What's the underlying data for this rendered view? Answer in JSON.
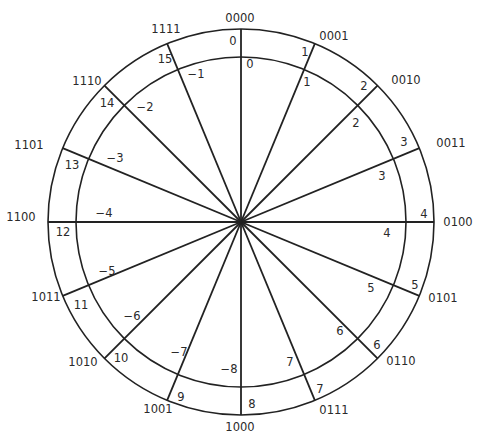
{
  "diagram": {
    "geometry": {
      "center": [
        241,
        222
      ],
      "outer_radius": 193,
      "inner_radius": 165,
      "spoke_count": 16,
      "start_angle_deg": 0,
      "direction": "clockwise"
    },
    "colors": {
      "line": "#222222",
      "text": "#2a2a2a",
      "background": "#ffffff"
    },
    "segments": [
      {
        "index": 0,
        "binary": "0000",
        "unsigned": "0",
        "signed": "0",
        "binary_pos": [
          240,
          18
        ],
        "unsigned_pos": [
          233,
          41
        ],
        "signed_pos": [
          250,
          64
        ]
      },
      {
        "index": 1,
        "binary": "0001",
        "unsigned": "1",
        "signed": "1",
        "binary_pos": [
          334,
          36
        ],
        "unsigned_pos": [
          305,
          52
        ],
        "signed_pos": [
          307,
          82
        ]
      },
      {
        "index": 2,
        "binary": "0010",
        "unsigned": "2",
        "signed": "2",
        "binary_pos": [
          406,
          80
        ],
        "unsigned_pos": [
          364,
          86
        ],
        "signed_pos": [
          356,
          123
        ]
      },
      {
        "index": 3,
        "binary": "0011",
        "unsigned": "3",
        "signed": "3",
        "binary_pos": [
          451,
          143
        ],
        "unsigned_pos": [
          404,
          142
        ],
        "signed_pos": [
          382,
          176
        ]
      },
      {
        "index": 4,
        "binary": "0100",
        "unsigned": "4",
        "signed": "4",
        "binary_pos": [
          458,
          222
        ],
        "unsigned_pos": [
          424,
          214
        ],
        "signed_pos": [
          387,
          233
        ]
      },
      {
        "index": 5,
        "binary": "0101",
        "unsigned": "5",
        "signed": "5",
        "binary_pos": [
          443,
          298
        ],
        "unsigned_pos": [
          415,
          285
        ],
        "signed_pos": [
          371,
          288
        ]
      },
      {
        "index": 6,
        "binary": "0110",
        "unsigned": "6",
        "signed": "6",
        "binary_pos": [
          401,
          361
        ],
        "unsigned_pos": [
          377,
          345
        ],
        "signed_pos": [
          340,
          331
        ]
      },
      {
        "index": 7,
        "binary": "0111",
        "unsigned": "7",
        "signed": "7",
        "binary_pos": [
          334,
          410
        ],
        "unsigned_pos": [
          320,
          389
        ],
        "signed_pos": [
          290,
          362
        ]
      },
      {
        "index": 8,
        "binary": "1000",
        "unsigned": "8",
        "signed": "−8",
        "binary_pos": [
          240,
          427
        ],
        "unsigned_pos": [
          252,
          404
        ],
        "signed_pos": [
          229,
          369
        ]
      },
      {
        "index": 9,
        "binary": "1001",
        "unsigned": "9",
        "signed": "−7",
        "binary_pos": [
          158,
          409
        ],
        "unsigned_pos": [
          181,
          397
        ],
        "signed_pos": [
          179,
          352
        ]
      },
      {
        "index": 10,
        "binary": "1010",
        "unsigned": "10",
        "signed": "−6",
        "binary_pos": [
          83,
          362
        ],
        "unsigned_pos": [
          121,
          358
        ],
        "signed_pos": [
          132,
          316
        ]
      },
      {
        "index": 11,
        "binary": "1011",
        "unsigned": "11",
        "signed": "−5",
        "binary_pos": [
          46,
          297
        ],
        "unsigned_pos": [
          81,
          305
        ],
        "signed_pos": [
          107,
          271
        ]
      },
      {
        "index": 12,
        "binary": "1100",
        "unsigned": "12",
        "signed": "−4",
        "binary_pos": [
          21,
          217
        ],
        "unsigned_pos": [
          63,
          232
        ],
        "signed_pos": [
          104,
          213
        ]
      },
      {
        "index": 13,
        "binary": "1101",
        "unsigned": "13",
        "signed": "−3",
        "binary_pos": [
          29,
          145
        ],
        "unsigned_pos": [
          72,
          165
        ],
        "signed_pos": [
          115,
          158
        ]
      },
      {
        "index": 14,
        "binary": "1110",
        "unsigned": "14",
        "signed": "−2",
        "binary_pos": [
          87,
          81
        ],
        "unsigned_pos": [
          107,
          103
        ],
        "signed_pos": [
          145,
          107
        ]
      },
      {
        "index": 15,
        "binary": "1111",
        "unsigned": "15",
        "signed": "−1",
        "binary_pos": [
          166,
          29
        ],
        "unsigned_pos": [
          165,
          59
        ],
        "signed_pos": [
          196,
          74
        ]
      }
    ]
  }
}
